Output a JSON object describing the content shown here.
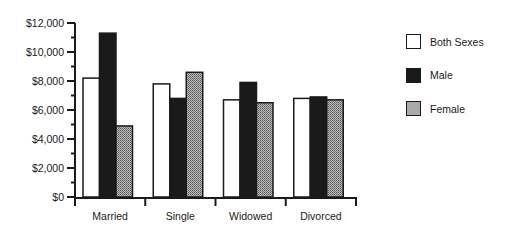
{
  "chart_data": {
    "type": "bar",
    "title": "",
    "xlabel": "",
    "ylabel": "",
    "categories": [
      "Married",
      "Single",
      "Widowed",
      "Divorced"
    ],
    "series": [
      {
        "name": "Both Sexes",
        "fill": "#ffffff",
        "values": [
          8200,
          7800,
          6700,
          6800
        ]
      },
      {
        "name": "Male",
        "fill": "#1a1a1a",
        "values": [
          11300,
          6800,
          7900,
          6900
        ]
      },
      {
        "name": "Female",
        "fill": "pattern-gray",
        "values": [
          4900,
          8600,
          6500,
          6700
        ]
      }
    ],
    "ylim": [
      0,
      12000
    ],
    "yticks": [
      0,
      2000,
      4000,
      6000,
      8000,
      10000,
      12000
    ],
    "ytick_labels": [
      "$0",
      "$2,000",
      "$4,000",
      "$6,000",
      "$8,000",
      "$10,000",
      "$12,000"
    ],
    "grid": false,
    "legend_position": "right"
  },
  "legend": {
    "items": [
      {
        "label": "Both Sexes"
      },
      {
        "label": "Male"
      },
      {
        "label": "Female"
      }
    ]
  }
}
